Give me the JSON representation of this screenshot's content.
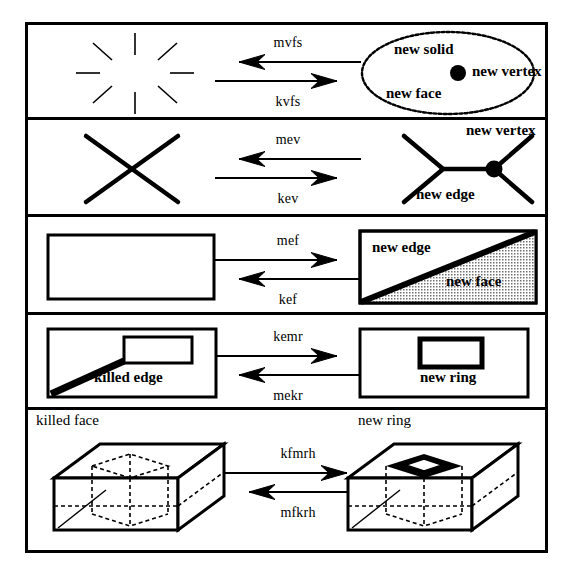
{
  "figure": {
    "rows": [
      {
        "id": "mvfs-kvfs",
        "left_shape": "starburst-void",
        "arrow_top": {
          "label": "mvfs",
          "direction": "left"
        },
        "arrow_bottom": {
          "label": "kvfs",
          "direction": "right"
        },
        "right_shape": "wavy-ellipse-with-vertex",
        "labels": [
          {
            "text": "new solid",
            "name": "new-solid-label"
          },
          {
            "text": "new vertex",
            "name": "new-vertex-label"
          },
          {
            "text": "new face",
            "name": "new-face-label"
          }
        ]
      },
      {
        "id": "mev-kev",
        "left_shape": "x-cross",
        "arrow_top": {
          "label": "mev",
          "direction": "left"
        },
        "arrow_bottom": {
          "label": "kev",
          "direction": "right"
        },
        "right_shape": "split-x-with-edge",
        "labels": [
          {
            "text": "new vertex",
            "name": "new-vertex-label"
          },
          {
            "text": "new edge",
            "name": "new-edge-label"
          }
        ]
      },
      {
        "id": "mef-kef",
        "left_shape": "empty-rectangle",
        "arrow_top": {
          "label": "mef",
          "direction": "right"
        },
        "arrow_bottom": {
          "label": "kef",
          "direction": "left"
        },
        "right_shape": "rectangle-split-diagonal-stippled",
        "labels": [
          {
            "text": "new edge",
            "name": "new-edge-label"
          },
          {
            "text": "new face",
            "name": "new-face-label"
          }
        ]
      },
      {
        "id": "kemr-mekr",
        "left_shape": "rectangle-with-bridged-inner-rect",
        "arrow_top": {
          "label": "kemr",
          "direction": "right"
        },
        "arrow_bottom": {
          "label": "mekr",
          "direction": "left"
        },
        "right_shape": "rectangle-with-free-inner-ring",
        "labels": [
          {
            "text": "killed edge",
            "name": "killed-edge-label"
          },
          {
            "text": "new ring",
            "name": "new-ring-label"
          }
        ]
      },
      {
        "id": "kfmrh-mfkrh",
        "left_shape": "box-with-dashed-inner-cavity",
        "arrow_top": {
          "label": "kfmrh",
          "direction": "right"
        },
        "arrow_bottom": {
          "label": "mfkrh",
          "direction": "left"
        },
        "right_shape": "box-with-hole-through-top",
        "labels": [
          {
            "text": "killed face",
            "name": "killed-face-label"
          },
          {
            "text": "new ring",
            "name": "new-ring-label"
          }
        ]
      }
    ],
    "colors": {
      "ink": "#000000",
      "paper": "#ffffff",
      "stipple": "#b9b9b9"
    }
  }
}
